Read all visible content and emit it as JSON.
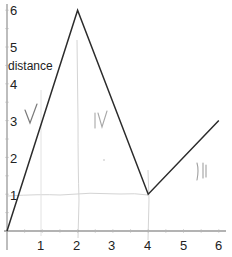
{
  "chart_data": {
    "type": "line",
    "title": "",
    "xlabel": "",
    "ylabel": "distance",
    "xlim": [
      0,
      6
    ],
    "ylim": [
      0,
      6
    ],
    "grid": false,
    "legend": null,
    "x_ticks": [
      "1",
      "2",
      "3",
      "4",
      "5",
      "6"
    ],
    "y_ticks": [
      "1",
      "2",
      "3",
      "4",
      "5",
      "6"
    ],
    "series": [
      {
        "name": "distance",
        "x": [
          0,
          2,
          4,
          6
        ],
        "y": [
          0,
          6,
          1,
          3
        ]
      }
    ],
    "annotations": [
      {
        "text": "V",
        "kind": "handwritten",
        "x": 0.8,
        "y": 3
      },
      {
        "text": "IV",
        "kind": "handwritten",
        "x": 2.7,
        "y": 3
      },
      {
        "text": "II",
        "kind": "handwritten",
        "x": 5.1,
        "y": 1.6
      },
      {
        "text": "faint pencil guide lines at y=1 and x=2, x=4",
        "kind": "pencil-marks"
      }
    ],
    "colors": {
      "line": "#2b2b2b",
      "axis": "#9a9a9a",
      "pencil": "#c8c8c8",
      "handwriting": "#8a8a8a"
    }
  }
}
